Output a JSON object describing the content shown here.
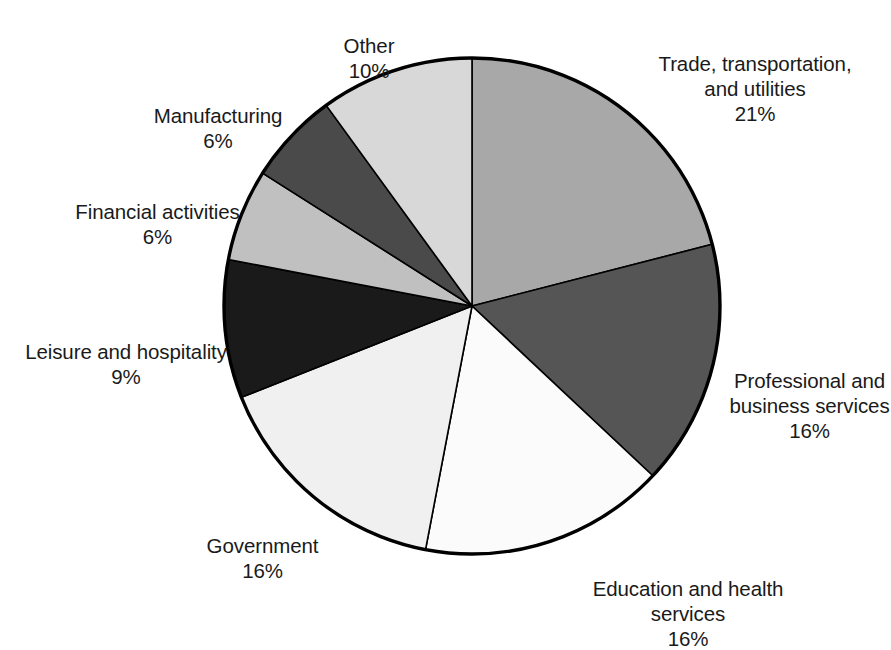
{
  "chart_data": {
    "type": "pie",
    "title": "",
    "subtitle": "",
    "units": "percent",
    "legend_position": "none",
    "labels_outside": true,
    "start_angle_deg": 0,
    "direction": "clockwise",
    "categories": [
      "Trade, transportation, and utilities",
      "Professional and business services",
      "Education and health services",
      "Government",
      "Leisure and hospitality",
      "Financial activities",
      "Manufacturing",
      "Other"
    ],
    "values": [
      21,
      16,
      16,
      16,
      9,
      6,
      6,
      10
    ],
    "value_labels": [
      "21%",
      "16%",
      "16%",
      "16%",
      "9%",
      "6%",
      "6%",
      "10%"
    ],
    "colors": [
      "#a8a8a8",
      "#555555",
      "#fbfbfb",
      "#f0f0f0",
      "#1a1a1a",
      "#c0c0c0",
      "#4a4a4a",
      "#d8d8d8"
    ],
    "slice_outline_color": "#000000",
    "total": 100
  },
  "pie": {
    "center_x": 472,
    "center_y": 306,
    "radius": 248,
    "slices": [
      {
        "key": "trade",
        "name": "Trade, transportation, and utilities",
        "value": 21,
        "color": "#a8a8a8"
      },
      {
        "key": "professional",
        "name": "Professional and business services",
        "value": 16,
        "color": "#555555"
      },
      {
        "key": "education",
        "name": "Education and health services",
        "value": 16,
        "color": "#fbfbfb"
      },
      {
        "key": "government",
        "name": "Government",
        "value": 16,
        "color": "#f0f0f0"
      },
      {
        "key": "leisure",
        "name": "Leisure and hospitality",
        "value": 9,
        "color": "#1a1a1a"
      },
      {
        "key": "financial",
        "name": "Financial activities",
        "value": 6,
        "color": "#c0c0c0"
      },
      {
        "key": "manufacturing",
        "name": "Manufacturing",
        "value": 6,
        "color": "#4a4a4a"
      },
      {
        "key": "other",
        "name": "Other",
        "value": 10,
        "color": "#d8d8d8"
      }
    ]
  },
  "labels": {
    "other": {
      "name": "Other",
      "pct": "10%"
    },
    "trade": {
      "name": "Trade, transportation,\nand utilities",
      "pct": "21%"
    },
    "manufacturing": {
      "name": "Manufacturing",
      "pct": "6%"
    },
    "financial": {
      "name": "Financial activities",
      "pct": "6%"
    },
    "leisure": {
      "name": "Leisure and hospitality",
      "pct": "9%"
    },
    "professional": {
      "name": "Professional and\nbusiness services",
      "pct": "16%"
    },
    "government": {
      "name": "Government",
      "pct": "16%"
    },
    "education": {
      "name": "Education and health\nservices",
      "pct": "16%"
    }
  }
}
